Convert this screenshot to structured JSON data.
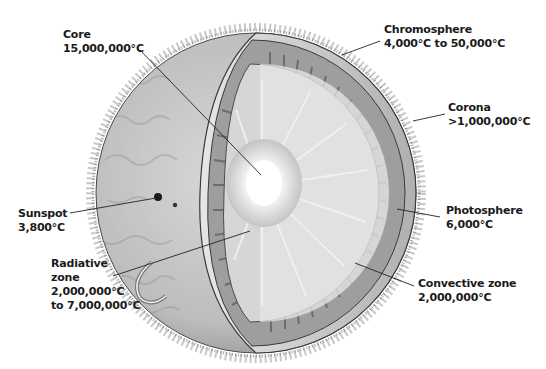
{
  "colors": {
    "background": "#ffffff",
    "surface": "#c9c9c9",
    "surface_dark": "#8f8f8f",
    "convective_band": "#9a9a9a",
    "radiative": "#dedede",
    "core": "#ffffff",
    "outline": "#3a3a3a",
    "leader": "#222222",
    "text": "#1a1a1a"
  },
  "labels": [
    {
      "id": "core",
      "name": "Core",
      "value": "15,000,000°C",
      "x": 31,
      "y": 22,
      "line": [
        140,
        50,
        261,
        175
      ]
    },
    {
      "id": "chromosphere",
      "name": "Chromosphere",
      "value": "4,000°C to 50,000°C",
      "x": 385,
      "y": 22,
      "line": [
        380,
        41,
        342,
        55
      ]
    },
    {
      "id": "corona",
      "name": "Corona",
      "value": ">1,000,000°C",
      "x": 448,
      "y": 102,
      "line": [
        445,
        114,
        413,
        121
      ]
    },
    {
      "id": "sunspot",
      "name": "Sunspot",
      "value": "3,800°C",
      "x": 18,
      "y": 206,
      "line": [
        70,
        213,
        156,
        198
      ]
    },
    {
      "id": "radiative",
      "name": "Radiative",
      "name2": "zone",
      "value": "2,000,000°C",
      "value2": "to 7,000,000°C",
      "x": 51,
      "y": 255,
      "line": [
        113,
        276,
        250,
        231
      ]
    },
    {
      "id": "photosphere",
      "name": "Photosphere",
      "value": "6,000°C",
      "x": 445,
      "y": 204,
      "line": [
        440,
        217,
        397,
        209
      ]
    },
    {
      "id": "convective",
      "name": "Convective zone",
      "value": "2,000,000°C",
      "x": 418,
      "y": 277,
      "line": [
        414,
        286,
        355,
        263
      ]
    }
  ]
}
